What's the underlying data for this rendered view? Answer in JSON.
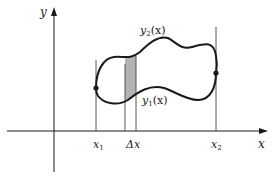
{
  "diagram": {
    "type": "area-between-curves",
    "axes": {
      "x_label": "x",
      "y_label": "y"
    },
    "curves": {
      "upper_label": "y",
      "upper_sub": "2",
      "upper_arg": "(x)",
      "lower_label": "y",
      "lower_sub": "1",
      "lower_arg": "(x)"
    },
    "markers": {
      "x1_label": "x",
      "x1_sub": "1",
      "x2_label": "x",
      "x2_sub": "2",
      "delta_label": "Δx"
    },
    "colors": {
      "line": "#1a1a1a",
      "strip_fill": "#b3b3b3",
      "guide": "#444444"
    }
  }
}
